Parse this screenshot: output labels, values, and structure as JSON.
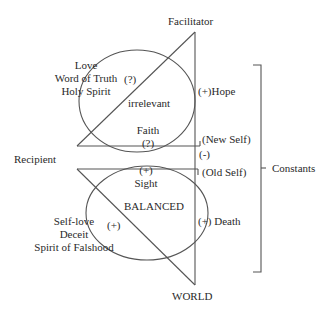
{
  "diagram": {
    "nodes": {
      "facilitator": "Facilitator",
      "recipient": "Recipient",
      "world": "WORLD",
      "constants": "Constants"
    },
    "upper_ellipse": {
      "label": "irrelevant",
      "left_list": [
        "Love",
        "Word of Truth",
        "Holy Spirit"
      ],
      "left_marker": "(?)",
      "bottom_label": "Faith",
      "bottom_marker": "(?)",
      "right_marker": "(+)",
      "right_label": "Hope"
    },
    "lower_ellipse": {
      "label": "BALANCED",
      "top_marker": "(+)",
      "top_label": "Sight",
      "left_list": [
        "Self-love",
        "Deceit",
        "Spirit of Falshood"
      ],
      "left_marker": "(+)",
      "right_marker": "(+)",
      "right_label": "Death"
    },
    "middle": {
      "new_self": "(New Self)",
      "neg_marker": "(-)",
      "old_self": "(Old Self)"
    },
    "colors": {
      "line": "#555555",
      "text": "#2a2a2a",
      "background": "#ffffff"
    }
  }
}
